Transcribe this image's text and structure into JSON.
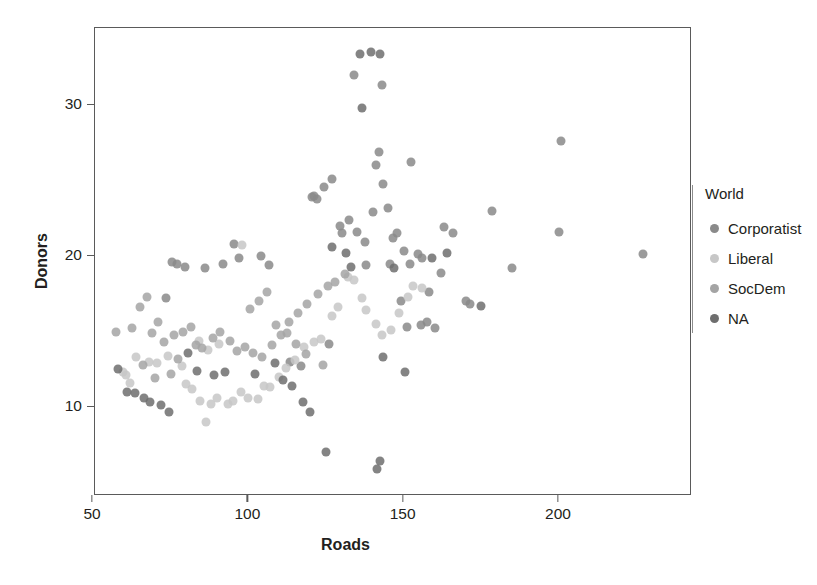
{
  "chart_data": {
    "type": "scatter",
    "title": "",
    "xlabel": "Roads",
    "ylabel": "Donors",
    "xlim": [
      55.5,
      247.0
    ],
    "ylim": [
      5.0,
      36.0
    ],
    "grid": false,
    "xticks": [
      50,
      100,
      150,
      200
    ],
    "xtick_labels": [
      "50",
      "100",
      "150",
      "200"
    ],
    "yticks": [
      10,
      20,
      30
    ],
    "ytick_labels": [
      "10",
      "20",
      "30"
    ],
    "legend": {
      "title": "World",
      "position": "right",
      "entries": [
        {
          "label": "Corporatist",
          "color": "#8a8a8a"
        },
        {
          "label": "Liberal",
          "color": "#c7c7c7"
        },
        {
          "label": "SocDem",
          "color": "#a4a4a4"
        },
        {
          "label": "NA",
          "color": "#6e6e6e"
        }
      ]
    },
    "marker": {
      "shape": "circle",
      "size_px": 9,
      "opacity": 0.85
    },
    "series": [
      {
        "name": "Corporatist",
        "color": "#8a8a8a",
        "points": [
          [
            73.5,
            17.2
          ],
          [
            75.5,
            19.6
          ],
          [
            77.0,
            19.5
          ],
          [
            79.5,
            19.3
          ],
          [
            86.0,
            19.2
          ],
          [
            92.0,
            19.5
          ],
          [
            95.5,
            20.8
          ],
          [
            97.0,
            19.9
          ],
          [
            104.0,
            20.0
          ],
          [
            106.5,
            19.4
          ],
          [
            120.5,
            23.9
          ],
          [
            122.0,
            23.8
          ],
          [
            121.0,
            24.0
          ],
          [
            124.5,
            24.6
          ],
          [
            127.0,
            25.1
          ],
          [
            130.0,
            21.5
          ],
          [
            132.5,
            22.4
          ],
          [
            135.0,
            21.6
          ],
          [
            137.5,
            20.9
          ],
          [
            140.0,
            22.9
          ],
          [
            142.0,
            26.9
          ],
          [
            143.5,
            24.8
          ],
          [
            145.0,
            23.2
          ],
          [
            146.5,
            21.2
          ],
          [
            148.0,
            21.5
          ],
          [
            150.0,
            20.3
          ],
          [
            152.0,
            19.5
          ],
          [
            154.5,
            20.1
          ],
          [
            156.0,
            19.9
          ],
          [
            157.5,
            15.6
          ],
          [
            160.0,
            15.2
          ],
          [
            163.0,
            21.9
          ],
          [
            166.0,
            21.5
          ],
          [
            170.0,
            17.0
          ],
          [
            171.5,
            16.8
          ],
          [
            178.5,
            23.0
          ],
          [
            185.0,
            19.2
          ],
          [
            200.5,
            27.6
          ],
          [
            200.0,
            21.6
          ],
          [
            227.0,
            20.1
          ],
          [
            134.0,
            32.0
          ],
          [
            143.0,
            31.3
          ],
          [
            141.0,
            26.0
          ],
          [
            152.5,
            26.2
          ],
          [
            129.5,
            22.0
          ],
          [
            138.0,
            19.4
          ],
          [
            145.5,
            19.5
          ],
          [
            149.0,
            17.0
          ],
          [
            151.0,
            15.3
          ],
          [
            155.5,
            15.4
          ],
          [
            158.0,
            17.6
          ],
          [
            162.0,
            18.9
          ],
          [
            113.5,
            13.0
          ],
          [
            117.0,
            12.7
          ],
          [
            126.0,
            14.2
          ]
        ]
      },
      {
        "name": "Liberal",
        "color": "#c7c7c7",
        "points": [
          [
            59.5,
            12.3
          ],
          [
            60.5,
            12.1
          ],
          [
            62.0,
            11.6
          ],
          [
            64.0,
            13.3
          ],
          [
            68.0,
            13.0
          ],
          [
            70.5,
            12.9
          ],
          [
            74.0,
            13.4
          ],
          [
            78.5,
            12.7
          ],
          [
            80.0,
            11.5
          ],
          [
            82.0,
            11.2
          ],
          [
            84.5,
            10.4
          ],
          [
            86.5,
            9.0
          ],
          [
            88.0,
            10.2
          ],
          [
            90.0,
            10.6
          ],
          [
            93.5,
            10.2
          ],
          [
            95.0,
            10.4
          ],
          [
            97.5,
            11.0
          ],
          [
            100.0,
            10.6
          ],
          [
            103.0,
            10.5
          ],
          [
            105.0,
            11.4
          ],
          [
            107.0,
            11.3
          ],
          [
            110.0,
            12.0
          ],
          [
            112.0,
            12.6
          ],
          [
            115.0,
            13.1
          ],
          [
            118.0,
            14.0
          ],
          [
            121.0,
            14.3
          ],
          [
            123.5,
            14.5
          ],
          [
            127.0,
            16.0
          ],
          [
            129.0,
            16.6
          ],
          [
            132.0,
            18.6
          ],
          [
            134.0,
            18.4
          ],
          [
            136.5,
            17.2
          ],
          [
            138.0,
            16.4
          ],
          [
            141.0,
            15.5
          ],
          [
            143.0,
            14.8
          ],
          [
            146.0,
            15.1
          ],
          [
            148.5,
            16.2
          ],
          [
            151.5,
            17.3
          ],
          [
            153.0,
            18.0
          ],
          [
            156.0,
            17.9
          ],
          [
            98.0,
            20.7
          ],
          [
            90.5,
            14.2
          ],
          [
            87.0,
            13.8
          ],
          [
            84.0,
            14.4
          ]
        ]
      },
      {
        "name": "SocDem",
        "color": "#a4a4a4",
        "points": [
          [
            57.5,
            15.0
          ],
          [
            62.5,
            15.2
          ],
          [
            65.0,
            16.6
          ],
          [
            67.5,
            17.3
          ],
          [
            69.0,
            14.9
          ],
          [
            71.0,
            15.6
          ],
          [
            73.0,
            14.3
          ],
          [
            76.0,
            14.8
          ],
          [
            79.0,
            15.0
          ],
          [
            81.5,
            15.3
          ],
          [
            83.0,
            14.1
          ],
          [
            85.0,
            13.9
          ],
          [
            88.5,
            14.6
          ],
          [
            91.0,
            15.0
          ],
          [
            94.0,
            14.4
          ],
          [
            96.5,
            13.7
          ],
          [
            99.0,
            14.0
          ],
          [
            101.5,
            13.6
          ],
          [
            104.5,
            13.3
          ],
          [
            107.5,
            14.1
          ],
          [
            110.5,
            14.8
          ],
          [
            113.0,
            15.6
          ],
          [
            116.0,
            16.2
          ],
          [
            119.0,
            16.8
          ],
          [
            122.5,
            17.5
          ],
          [
            125.5,
            18.0
          ],
          [
            128.0,
            18.3
          ],
          [
            131.0,
            18.8
          ],
          [
            66.0,
            12.8
          ],
          [
            70.0,
            11.9
          ],
          [
            75.0,
            12.2
          ],
          [
            77.5,
            13.2
          ],
          [
            100.5,
            16.5
          ],
          [
            103.5,
            17.0
          ],
          [
            106.0,
            17.6
          ],
          [
            109.0,
            15.4
          ],
          [
            112.5,
            14.9
          ],
          [
            115.5,
            14.2
          ],
          [
            118.5,
            13.5
          ],
          [
            124.0,
            12.8
          ]
        ]
      },
      {
        "name": "NA",
        "color": "#6e6e6e",
        "points": [
          [
            58.0,
            12.5
          ],
          [
            61.0,
            11.0
          ],
          [
            63.5,
            10.9
          ],
          [
            66.5,
            10.6
          ],
          [
            68.5,
            10.3
          ],
          [
            72.0,
            10.1
          ],
          [
            74.5,
            9.7
          ],
          [
            80.5,
            13.6
          ],
          [
            83.5,
            12.4
          ],
          [
            89.0,
            12.1
          ],
          [
            92.5,
            12.3
          ],
          [
            102.0,
            12.2
          ],
          [
            108.5,
            12.9
          ],
          [
            111.0,
            11.8
          ],
          [
            114.0,
            11.4
          ],
          [
            117.5,
            10.3
          ],
          [
            120.0,
            9.7
          ],
          [
            125.0,
            7.0
          ],
          [
            136.0,
            33.4
          ],
          [
            139.5,
            33.5
          ],
          [
            142.5,
            33.4
          ],
          [
            136.5,
            29.8
          ],
          [
            143.5,
            13.3
          ],
          [
            141.5,
            5.9
          ],
          [
            142.5,
            6.4
          ],
          [
            127.0,
            20.6
          ],
          [
            131.5,
            20.2
          ],
          [
            133.0,
            19.3
          ],
          [
            147.0,
            19.2
          ],
          [
            150.5,
            12.3
          ],
          [
            159.0,
            19.9
          ],
          [
            164.0,
            20.2
          ],
          [
            175.0,
            16.7
          ]
        ]
      }
    ]
  },
  "axes": {
    "x_pixel_at_50": 92,
    "x_pixel_at_200": 558,
    "y_pixel_at_10": 406,
    "y_pixel_at_30": 104
  }
}
